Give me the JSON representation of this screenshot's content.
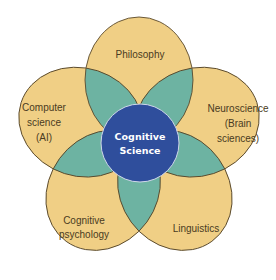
{
  "diagram": {
    "type": "venn",
    "center": {
      "label_line1": "Cognitive",
      "label_line2": "Science"
    },
    "petals": [
      {
        "id": "philosophy",
        "lines": [
          "Philosophy"
        ]
      },
      {
        "id": "neuroscience",
        "lines": [
          "Neuroscience",
          "(Brain",
          "sciences)"
        ]
      },
      {
        "id": "linguistics",
        "lines": [
          "Linguistics"
        ]
      },
      {
        "id": "cognitive-psychology",
        "lines": [
          "Cognitive",
          "psychology"
        ]
      },
      {
        "id": "computer-science",
        "lines": [
          "Computer",
          "science",
          "(AI)"
        ]
      }
    ],
    "colors": {
      "petal_fill": "#f0cf85",
      "pair_overlap": "#6db3a2",
      "triple_overlap": "#1e9370",
      "center_circle": "#2f4e9c",
      "outline": "#5a4a2c",
      "background": "#ffffff"
    }
  }
}
